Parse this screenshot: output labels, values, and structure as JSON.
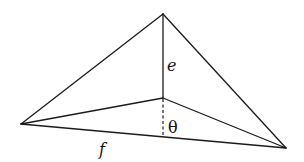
{
  "diagram": {
    "type": "tetrahedron-projection",
    "vertices": {
      "apex": {
        "x": 163,
        "y": 14
      },
      "inner": {
        "x": 163,
        "y": 98
      },
      "left": {
        "x": 21,
        "y": 124
      },
      "right": {
        "x": 286,
        "y": 148
      },
      "foot": {
        "x": 163,
        "y": 137
      }
    },
    "labels": {
      "e": "e",
      "f": "f",
      "theta": "θ"
    },
    "colors": {
      "stroke": "#1a1a1a",
      "background": "#ffffff"
    }
  }
}
